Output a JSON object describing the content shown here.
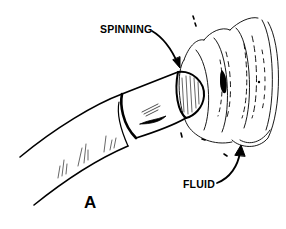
{
  "figure": {
    "panel_label": "A",
    "labels": {
      "spinning": "SPINNING",
      "fluid": "FLUID"
    },
    "colors": {
      "ink": "#000000",
      "background": "#ffffff"
    },
    "subjects": [
      "rotating-shaft",
      "shaft-collar",
      "shaft-end",
      "fluid-vortex"
    ]
  }
}
